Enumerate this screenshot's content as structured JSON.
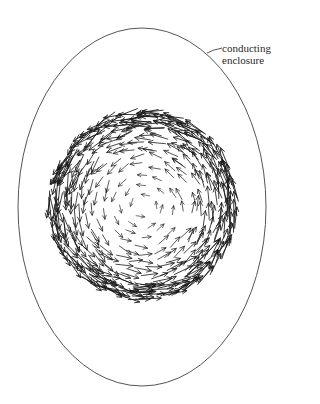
{
  "figure": {
    "annotation": {
      "line1": "conducting",
      "line2": "enclosure"
    },
    "enclosure": {
      "shape": "ellipse",
      "cx": 142,
      "cy": 207,
      "rx": 124,
      "ry": 179,
      "stroke": "#555555"
    },
    "vector_field": {
      "description": "circulating vector field (arrows) inside enclosure",
      "circulation": "counterclockwise",
      "cx": 143,
      "cy": 205,
      "outer_radius": 95,
      "arrow_color": "#1a1a1a"
    }
  }
}
